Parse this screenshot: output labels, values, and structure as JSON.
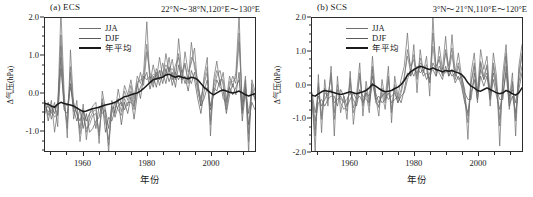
{
  "figure": {
    "y_axis_label": "Δ气压(hPa)",
    "x_axis_label": "年份",
    "legend": [
      {
        "label": "JJA",
        "color": "#6e6e6e",
        "width": 1.0
      },
      {
        "label": "DJF",
        "color": "#5a5a5a",
        "width": 1.0
      },
      {
        "label": "年平均",
        "color": "#1a1a1a",
        "width": 2.0
      }
    ]
  },
  "chart_data": [
    {
      "type": "line",
      "panel": "a",
      "tag": "(a) ECS",
      "title": "22°N～38°N,120°E～130°E",
      "xlabel": "年份",
      "ylabel": "Δ气压(hPa)",
      "xlim": [
        1948,
        2014
      ],
      "ylim": [
        -1.55,
        2.0
      ],
      "xticks": [
        1960,
        1980,
        2000
      ],
      "xticklabels": [
        "1960",
        "1980",
        "2000"
      ],
      "xminor_step": 5,
      "yticks": [
        -1.0,
        0.0,
        1.0,
        2.0
      ],
      "yticklabels": [
        "-1.0",
        "0.0",
        "1.0",
        "2.0"
      ],
      "yminor_step": 0.25,
      "grid": false,
      "legend_position": "top-left",
      "x": [
        1948,
        1949,
        1950,
        1951,
        1952,
        1953,
        1954,
        1955,
        1956,
        1957,
        1958,
        1959,
        1960,
        1961,
        1962,
        1963,
        1964,
        1965,
        1966,
        1967,
        1968,
        1969,
        1970,
        1971,
        1972,
        1973,
        1974,
        1975,
        1976,
        1977,
        1978,
        1979,
        1980,
        1981,
        1982,
        1983,
        1984,
        1985,
        1986,
        1987,
        1988,
        1989,
        1990,
        1991,
        1992,
        1993,
        1994,
        1995,
        1996,
        1997,
        1998,
        1999,
        2000,
        2001,
        2002,
        2003,
        2004,
        2005,
        2006,
        2007,
        2008,
        2009,
        2010,
        2011,
        2012,
        2013,
        2014
      ],
      "series": [
        {
          "name": "JJA",
          "color": "#6e6e6e",
          "values": [
            -0.3,
            -0.6,
            -0.2,
            -1.05,
            -0.45,
            2.2,
            0.05,
            -1.2,
            1.15,
            -0.35,
            -0.55,
            -0.95,
            -0.3,
            -1.25,
            -0.55,
            -0.35,
            -0.25,
            -1.35,
            0.05,
            -0.45,
            -1.6,
            -0.2,
            -0.55,
            0.1,
            -0.35,
            0.2,
            -0.05,
            0.35,
            -0.15,
            0.45,
            0.25,
            0.55,
            1.9,
            0.25,
            0.75,
            0.35,
            0.95,
            0.4,
            1.05,
            0.55,
            0.9,
            0.35,
            1.45,
            0.55,
            0.8,
            0.25,
            1.35,
            0.65,
            0.35,
            -0.35,
            0.45,
            0.95,
            -1.15,
            0.35,
            0.85,
            0.2,
            0.55,
            -0.2,
            0.45,
            0.15,
            0.55,
            2.1,
            -0.55,
            0.25,
            -1.6,
            0.35,
            0.05
          ]
        },
        {
          "name": "JJA-2",
          "color": "#707070",
          "values": [
            -0.45,
            -0.35,
            -0.55,
            -0.25,
            -0.9,
            1.55,
            -0.35,
            -0.8,
            0.55,
            -0.7,
            -0.2,
            -1.3,
            -0.65,
            -0.95,
            -0.85,
            -0.6,
            -0.55,
            -1.05,
            -0.35,
            -0.75,
            -1.25,
            -0.55,
            -0.25,
            -0.45,
            -0.6,
            -0.15,
            -0.35,
            0.05,
            -0.45,
            0.15,
            0.55,
            0.2,
            1.1,
            0.55,
            0.25,
            0.65,
            0.35,
            0.8,
            0.45,
            0.95,
            0.35,
            0.75,
            0.95,
            0.25,
            1.1,
            0.55,
            0.8,
            1.2,
            0.15,
            -0.15,
            0.25,
            0.55,
            -0.75,
            0.15,
            0.45,
            0.6,
            0.2,
            -0.45,
            0.15,
            0.45,
            0.25,
            1.35,
            -0.25,
            0.45,
            -1.1,
            0.15,
            -0.2
          ]
        },
        {
          "name": "DJF",
          "color": "#5a5a5a",
          "values": [
            -0.2,
            -0.75,
            -0.35,
            -0.55,
            -0.25,
            0.95,
            -0.45,
            -0.55,
            0.25,
            -0.45,
            -0.75,
            -0.45,
            -0.95,
            -0.55,
            -1.05,
            -0.95,
            -0.75,
            -0.65,
            -0.25,
            -1.05,
            -0.65,
            -0.75,
            -0.45,
            -0.15,
            -0.85,
            -0.25,
            -0.55,
            -0.1,
            -0.7,
            -0.05,
            0.15,
            0.35,
            0.55,
            0.1,
            0.45,
            0.15,
            0.6,
            0.25,
            0.65,
            0.3,
            0.55,
            0.15,
            0.75,
            0.35,
            0.45,
            0.05,
            0.6,
            0.35,
            -0.15,
            -0.55,
            0.05,
            0.35,
            -0.45,
            -0.05,
            0.35,
            0.15,
            0.05,
            -0.55,
            -0.05,
            0.25,
            -0.05,
            0.55,
            -0.75,
            0.05,
            -0.85,
            -0.25,
            -0.45
          ]
        },
        {
          "name": "DJF-2",
          "color": "#5e5e5e",
          "values": [
            -0.55,
            -0.25,
            -0.7,
            -0.35,
            -0.6,
            0.65,
            -0.25,
            -0.35,
            0.15,
            -0.25,
            -0.55,
            -0.75,
            -0.45,
            -0.75,
            -0.55,
            -0.45,
            -0.95,
            -0.35,
            -0.55,
            -0.45,
            -0.95,
            -0.35,
            -0.65,
            -0.35,
            -0.25,
            -0.45,
            -0.25,
            -0.25,
            -0.35,
            0.25,
            -0.15,
            0.45,
            0.35,
            0.45,
            0.15,
            0.55,
            0.2,
            0.55,
            0.25,
            0.7,
            0.2,
            0.55,
            0.35,
            0.6,
            0.25,
            0.45,
            0.25,
            0.55,
            0.05,
            -0.35,
            -0.15,
            0.15,
            -0.35,
            0.15,
            0.05,
            0.35,
            -0.15,
            -0.25,
            0.15,
            -0.05,
            0.15,
            0.35,
            -0.45,
            0.15,
            -0.55,
            0.05,
            -0.15
          ]
        },
        {
          "name": "seasonal-extra",
          "color": "#787878",
          "values": [
            -0.35,
            -0.5,
            -0.45,
            -0.65,
            -0.55,
            1.25,
            -0.15,
            -0.95,
            0.7,
            -0.5,
            -0.4,
            -1.1,
            -0.5,
            -1.05,
            -0.7,
            -0.5,
            -0.45,
            -1.15,
            -0.15,
            -0.6,
            -1.4,
            -0.4,
            -0.4,
            -0.2,
            -0.5,
            0.05,
            -0.2,
            0.2,
            -0.3,
            0.3,
            0.35,
            0.4,
            1.3,
            0.35,
            0.5,
            0.45,
            0.6,
            0.55,
            0.75,
            0.6,
            0.65,
            0.5,
            1.05,
            0.4,
            0.75,
            0.35,
            0.95,
            0.8,
            0.25,
            -0.25,
            0.35,
            0.7,
            -0.85,
            0.25,
            0.6,
            0.35,
            0.35,
            -0.35,
            0.3,
            0.3,
            0.4,
            1.6,
            -0.4,
            0.35,
            -1.3,
            0.25,
            -0.1
          ]
        },
        {
          "name": "年平均",
          "color": "#1a1a1a",
          "values": [
            -0.28,
            -0.3,
            -0.35,
            -0.38,
            -0.3,
            -0.25,
            -0.28,
            -0.3,
            -0.32,
            -0.35,
            -0.4,
            -0.45,
            -0.5,
            -0.48,
            -0.45,
            -0.42,
            -0.4,
            -0.38,
            -0.35,
            -0.32,
            -0.3,
            -0.28,
            -0.25,
            -0.2,
            -0.15,
            -0.1,
            -0.08,
            -0.05,
            -0.02,
            0.0,
            0.05,
            0.12,
            0.2,
            0.28,
            0.35,
            0.38,
            0.4,
            0.42,
            0.48,
            0.5,
            0.45,
            0.42,
            0.45,
            0.42,
            0.4,
            0.38,
            0.42,
            0.4,
            0.35,
            0.25,
            0.15,
            0.08,
            0.0,
            -0.05,
            0.0,
            0.05,
            0.08,
            0.05,
            0.02,
            0.0,
            0.02,
            0.05,
            0.0,
            -0.05,
            -0.08,
            -0.05,
            -0.02
          ]
        }
      ]
    },
    {
      "type": "line",
      "panel": "b",
      "tag": "(b) SCS",
      "title": "3°N～21°N,110°E～120°E",
      "xlabel": "年份",
      "ylabel": "Δ气压(hPa)",
      "xlim": [
        1948,
        2014
      ],
      "ylim": [
        -2.0,
        2.0
      ],
      "xticks": [
        1960,
        1980,
        2000
      ],
      "xticklabels": [
        "1960",
        "1980",
        "2000"
      ],
      "xminor_step": 5,
      "yticks": [
        -2.0,
        -1.0,
        0.0,
        1.0,
        2.0
      ],
      "yticklabels": [
        "-2.0",
        "-1.0",
        "0.0",
        "1.0",
        "2.0"
      ],
      "yminor_step": 0.25,
      "grid": false,
      "legend_position": "top-left",
      "x": [
        1948,
        1949,
        1950,
        1951,
        1952,
        1953,
        1954,
        1955,
        1956,
        1957,
        1958,
        1959,
        1960,
        1961,
        1962,
        1963,
        1964,
        1965,
        1966,
        1967,
        1968,
        1969,
        1970,
        1971,
        1972,
        1973,
        1974,
        1975,
        1976,
        1977,
        1978,
        1979,
        1980,
        1981,
        1982,
        1983,
        1984,
        1985,
        1986,
        1987,
        1988,
        1989,
        1990,
        1991,
        1992,
        1993,
        1994,
        1995,
        1996,
        1997,
        1998,
        1999,
        2000,
        2001,
        2002,
        2003,
        2004,
        2005,
        2006,
        2007,
        2008,
        2009,
        2010,
        2011,
        2012,
        2013,
        2014
      ],
      "series": [
        {
          "name": "JJA",
          "color": "#6e6e6e",
          "values": [
            -0.35,
            -2.0,
            0.3,
            -1.45,
            0.15,
            -0.65,
            0.55,
            -1.55,
            0.25,
            -0.85,
            -0.35,
            -1.05,
            0.4,
            -1.2,
            -0.3,
            0.65,
            -0.95,
            0.1,
            -0.55,
            0.85,
            -0.35,
            -0.95,
            0.15,
            -0.45,
            0.55,
            -1.15,
            0.25,
            -0.35,
            0.15,
            0.55,
            1.55,
            0.25,
            1.2,
            -0.25,
            1.05,
            0.35,
            0.85,
            -0.35,
            2.05,
            0.25,
            1.15,
            0.45,
            1.45,
            0.25,
            1.5,
            0.35,
            0.95,
            0.25,
            -0.15,
            -1.65,
            0.35,
            0.95,
            -0.25,
            1.05,
            0.45,
            0.85,
            -0.35,
            0.95,
            0.25,
            -1.85,
            0.35,
            1.2,
            -0.45,
            0.35,
            -1.55,
            0.55,
            1.2
          ]
        },
        {
          "name": "JJA-2",
          "color": "#707070",
          "values": [
            -0.55,
            -1.55,
            -0.05,
            -1.05,
            -0.25,
            -0.35,
            0.25,
            -1.05,
            -0.15,
            -0.55,
            -0.75,
            -0.65,
            0.05,
            -0.85,
            -0.55,
            0.25,
            -0.65,
            -0.25,
            -0.85,
            0.45,
            -0.55,
            -0.65,
            -0.25,
            -0.75,
            0.15,
            -0.85,
            -0.15,
            -0.55,
            -0.25,
            0.15,
            1.05,
            0.55,
            0.75,
            0.15,
            0.65,
            0.55,
            0.45,
            0.05,
            1.55,
            0.55,
            0.75,
            0.25,
            1.05,
            0.55,
            1.1,
            0.15,
            0.55,
            0.05,
            -0.45,
            -1.15,
            0.05,
            0.55,
            -0.55,
            0.65,
            0.15,
            0.55,
            -0.65,
            0.55,
            -0.05,
            -1.25,
            0.05,
            0.85,
            -0.75,
            0.05,
            -1.1,
            0.25,
            0.85
          ]
        },
        {
          "name": "DJF",
          "color": "#5a5a5a",
          "values": [
            -0.25,
            -0.85,
            -0.35,
            -0.65,
            -0.45,
            -0.25,
            -0.15,
            -0.55,
            -0.45,
            -0.35,
            -0.55,
            -0.45,
            -0.25,
            -0.45,
            -0.65,
            -0.15,
            -0.35,
            -0.45,
            -0.55,
            0.05,
            -0.45,
            -0.35,
            -0.55,
            -0.45,
            -0.25,
            -0.55,
            -0.45,
            -0.35,
            -0.55,
            -0.15,
            0.35,
            0.25,
            0.45,
            0.35,
            0.55,
            0.25,
            0.35,
            0.15,
            0.65,
            0.45,
            0.35,
            0.15,
            0.55,
            0.25,
            0.45,
            0.05,
            0.25,
            -0.05,
            -0.55,
            -0.85,
            -0.25,
            0.15,
            -0.45,
            0.25,
            -0.05,
            0.25,
            -0.45,
            0.15,
            -0.35,
            -0.75,
            -0.25,
            0.35,
            -0.65,
            -0.35,
            -0.85,
            -0.15,
            0.35
          ]
        },
        {
          "name": "DJF-2",
          "color": "#5e5e5e",
          "values": [
            -0.45,
            -1.1,
            -0.55,
            -0.45,
            -0.65,
            -0.45,
            -0.35,
            -0.35,
            -0.65,
            -0.15,
            -0.35,
            -0.65,
            -0.45,
            -0.25,
            -0.45,
            -0.35,
            -0.55,
            -0.25,
            -0.35,
            0.25,
            -0.25,
            -0.55,
            -0.35,
            -0.25,
            -0.45,
            -0.35,
            -0.25,
            -0.55,
            -0.35,
            -0.25,
            0.15,
            0.45,
            0.25,
            0.55,
            0.35,
            0.45,
            0.15,
            0.35,
            0.45,
            0.25,
            0.55,
            0.35,
            0.35,
            0.45,
            0.25,
            0.35,
            0.15,
            0.25,
            -0.25,
            -0.45,
            -0.45,
            0.35,
            -0.25,
            0.45,
            0.15,
            0.35,
            -0.25,
            0.35,
            -0.15,
            -0.45,
            -0.45,
            0.55,
            -0.35,
            -0.15,
            -0.55,
            0.05,
            0.55
          ]
        },
        {
          "name": "seasonal-extra",
          "color": "#787878",
          "values": [
            -0.4,
            -1.35,
            0.05,
            -0.95,
            -0.1,
            -0.45,
            0.35,
            -0.85,
            0.0,
            -0.45,
            -0.5,
            -0.8,
            0.2,
            -0.7,
            -0.45,
            0.35,
            -0.55,
            -0.1,
            -0.65,
            0.55,
            -0.4,
            -0.7,
            -0.1,
            -0.55,
            0.25,
            -0.75,
            0.0,
            -0.45,
            -0.15,
            0.25,
            0.85,
            0.4,
            0.9,
            0.25,
            0.8,
            0.4,
            0.6,
            0.05,
            1.15,
            0.4,
            0.85,
            0.3,
            0.95,
            0.4,
            0.9,
            0.25,
            0.65,
            0.1,
            -0.3,
            -0.95,
            0.05,
            0.65,
            -0.4,
            0.7,
            0.25,
            0.6,
            -0.45,
            0.65,
            0.05,
            -1.05,
            0.0,
            0.95,
            -0.55,
            0.1,
            -1.0,
            0.35,
            0.95
          ]
        },
        {
          "name": "年平均",
          "color": "#1a1a1a",
          "values": [
            -0.32,
            -0.35,
            -0.28,
            -0.22,
            -0.18,
            -0.2,
            -0.22,
            -0.25,
            -0.28,
            -0.3,
            -0.28,
            -0.25,
            -0.22,
            -0.25,
            -0.28,
            -0.25,
            -0.22,
            -0.18,
            -0.1,
            0.0,
            -0.05,
            -0.12,
            -0.18,
            -0.22,
            -0.2,
            -0.18,
            -0.12,
            -0.08,
            0.0,
            0.12,
            0.28,
            0.38,
            0.45,
            0.5,
            0.55,
            0.52,
            0.48,
            0.45,
            0.5,
            0.45,
            0.42,
            0.38,
            0.42,
            0.4,
            0.42,
            0.38,
            0.35,
            0.3,
            0.2,
            0.05,
            -0.05,
            -0.1,
            -0.18,
            -0.2,
            -0.15,
            -0.1,
            -0.15,
            -0.2,
            -0.25,
            -0.28,
            -0.25,
            -0.18,
            -0.22,
            -0.28,
            -0.32,
            -0.25,
            -0.1
          ]
        }
      ]
    }
  ]
}
